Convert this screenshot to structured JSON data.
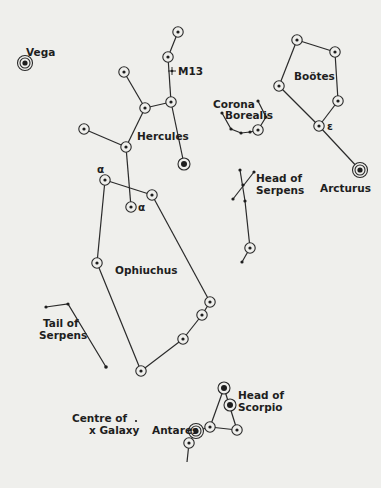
{
  "diagram": {
    "type": "star-chart",
    "background": "#efefec",
    "ink": "#2a2a2a",
    "constellations": [
      {
        "name": "Hercules",
        "label": "Hercules"
      },
      {
        "name": "Bootes",
        "label": "Boötes"
      },
      {
        "name": "Corona Borealis",
        "label_line1": "Corona",
        "label_line2": "Borealis"
      },
      {
        "name": "Head of Serpens",
        "label_line1": "Head of",
        "label_line2": "Serpens"
      },
      {
        "name": "Ophiuchus",
        "label": "Ophiuchus"
      },
      {
        "name": "Tail of Serpens",
        "label_line1": "Tail of",
        "label_line2": "Serpens"
      },
      {
        "name": "Head of Scorpio",
        "label_line1": "Head of",
        "label_line2": "Scorpio"
      }
    ],
    "stars": {
      "vega": "Vega",
      "arcturus": "Arcturus",
      "antares": "Antares",
      "m13": "M13",
      "epsilon": "ε",
      "alpha_hercules": "α",
      "alpha_ophiuchus": "α"
    },
    "galaxy_centre": {
      "line1": "Centre of",
      "line2": "x Galaxy"
    }
  }
}
